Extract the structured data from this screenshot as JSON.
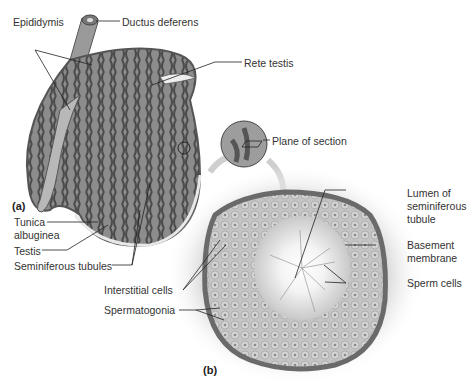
{
  "figure": {
    "panel_a": {
      "tag": "(a)",
      "labels": {
        "epididymis": "Epididymis",
        "ductus_deferens": "Ductus deferens",
        "rete_testis": "Rete testis",
        "tunica_albuginea_1": "Tunica",
        "tunica_albuginea_2": "albuginea",
        "testis": "Testis",
        "seminiferous_tubules": "Seminiferous tubules"
      }
    },
    "inset": {
      "plane_of_section": "Plane of section"
    },
    "panel_b": {
      "tag": "(b)",
      "labels": {
        "lumen_1": "Lumen of",
        "lumen_2": "seminiferous",
        "lumen_3": "tubule",
        "basement_1": "Basement",
        "basement_2": "membrane",
        "sperm_cells": "Sperm cells",
        "interstitial_cells": "Interstitial cells",
        "spermatogonia": "Spermatogonia"
      }
    }
  }
}
